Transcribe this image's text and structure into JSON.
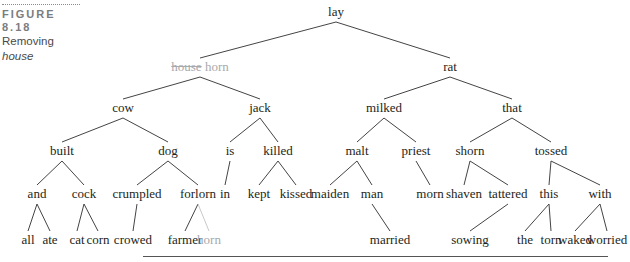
{
  "caption": {
    "label": "FIGURE 8.18",
    "title_prefix": "Removing ",
    "title_italic": "house"
  },
  "colors": {
    "text": "#231f20",
    "removed": "#a7a9ac",
    "line": "#444444",
    "removed_line": "#c8c9cb"
  },
  "tree": {
    "nodes": [
      {
        "id": "lay",
        "label": "lay",
        "x": 336,
        "y": 5
      },
      {
        "id": "househorn",
        "label": "house",
        "label2": "horn",
        "x": 200,
        "y": 60,
        "removed": true
      },
      {
        "id": "rat",
        "label": "rat",
        "x": 450,
        "y": 60
      },
      {
        "id": "cow",
        "label": "cow",
        "x": 123,
        "y": 101
      },
      {
        "id": "jack",
        "label": "jack",
        "x": 260,
        "y": 101
      },
      {
        "id": "milked",
        "label": "milked",
        "x": 384,
        "y": 101
      },
      {
        "id": "that",
        "label": "that",
        "x": 512,
        "y": 101
      },
      {
        "id": "built",
        "label": "built",
        "x": 62,
        "y": 144
      },
      {
        "id": "dog",
        "label": "dog",
        "x": 168,
        "y": 144
      },
      {
        "id": "is",
        "label": "is",
        "x": 230,
        "y": 144
      },
      {
        "id": "killed",
        "label": "killed",
        "x": 278,
        "y": 144
      },
      {
        "id": "malt",
        "label": "malt",
        "x": 357,
        "y": 144
      },
      {
        "id": "priest",
        "label": "priest",
        "x": 416,
        "y": 144
      },
      {
        "id": "shorn",
        "label": "shorn",
        "x": 470,
        "y": 144
      },
      {
        "id": "tossed",
        "label": "tossed",
        "x": 551,
        "y": 144
      },
      {
        "id": "and",
        "label": "and",
        "x": 37,
        "y": 187
      },
      {
        "id": "cock",
        "label": "cock",
        "x": 84,
        "y": 187
      },
      {
        "id": "crumpled",
        "label": "crumpled",
        "x": 137,
        "y": 187
      },
      {
        "id": "forlorn",
        "label": "forlorn",
        "x": 198,
        "y": 187
      },
      {
        "id": "in",
        "label": "in",
        "x": 225,
        "y": 187
      },
      {
        "id": "kept",
        "label": "kept",
        "x": 259,
        "y": 187
      },
      {
        "id": "kissed",
        "label": "kissed",
        "x": 296,
        "y": 187
      },
      {
        "id": "maiden",
        "label": "maiden",
        "x": 330,
        "y": 187
      },
      {
        "id": "man",
        "label": "man",
        "x": 372,
        "y": 187
      },
      {
        "id": "morn",
        "label": "morn",
        "x": 430,
        "y": 187
      },
      {
        "id": "shaven",
        "label": "shaven",
        "x": 464,
        "y": 187
      },
      {
        "id": "tattered",
        "label": "tattered",
        "x": 508,
        "y": 187
      },
      {
        "id": "this",
        "label": "this",
        "x": 549,
        "y": 187
      },
      {
        "id": "with",
        "label": "with",
        "x": 600,
        "y": 187
      },
      {
        "id": "all",
        "label": "all",
        "x": 28,
        "y": 233
      },
      {
        "id": "ate",
        "label": "ate",
        "x": 50,
        "y": 233
      },
      {
        "id": "cat",
        "label": "cat",
        "x": 77,
        "y": 233
      },
      {
        "id": "corn",
        "label": "corn",
        "x": 98,
        "y": 233
      },
      {
        "id": "crowed",
        "label": "crowed",
        "x": 133,
        "y": 233
      },
      {
        "id": "farmer",
        "label": "farmer",
        "x": 185,
        "y": 233
      },
      {
        "id": "horn",
        "label": "horn",
        "x": 209,
        "y": 233,
        "removed": true
      },
      {
        "id": "married",
        "label": "married",
        "x": 390,
        "y": 233
      },
      {
        "id": "sowing",
        "label": "sowing",
        "x": 470,
        "y": 233
      },
      {
        "id": "the",
        "label": "the",
        "x": 525,
        "y": 233
      },
      {
        "id": "torn",
        "label": "torn",
        "x": 551,
        "y": 233
      },
      {
        "id": "waked",
        "label": "waked",
        "x": 575,
        "y": 233
      },
      {
        "id": "worried",
        "label": "worried",
        "x": 607,
        "y": 233
      }
    ],
    "edges": [
      [
        "lay",
        "househorn"
      ],
      [
        "lay",
        "rat"
      ],
      [
        "househorn",
        "cow"
      ],
      [
        "househorn",
        "jack"
      ],
      [
        "rat",
        "milked"
      ],
      [
        "rat",
        "that"
      ],
      [
        "cow",
        "built"
      ],
      [
        "cow",
        "dog"
      ],
      [
        "jack",
        "is"
      ],
      [
        "jack",
        "killed"
      ],
      [
        "milked",
        "malt"
      ],
      [
        "milked",
        "priest"
      ],
      [
        "that",
        "shorn"
      ],
      [
        "that",
        "tossed"
      ],
      [
        "built",
        "and"
      ],
      [
        "built",
        "cock"
      ],
      [
        "dog",
        "crumpled"
      ],
      [
        "dog",
        "forlorn"
      ],
      [
        "is",
        "in"
      ],
      [
        "killed",
        "kept"
      ],
      [
        "killed",
        "kissed"
      ],
      [
        "malt",
        "maiden"
      ],
      [
        "malt",
        "man"
      ],
      [
        "priest",
        "morn"
      ],
      [
        "shorn",
        "shaven"
      ],
      [
        "shorn",
        "tattered"
      ],
      [
        "tossed",
        "this"
      ],
      [
        "tossed",
        "with"
      ],
      [
        "and",
        "all"
      ],
      [
        "and",
        "ate"
      ],
      [
        "cock",
        "cat"
      ],
      [
        "cock",
        "corn"
      ],
      [
        "crumpled",
        "crowed"
      ],
      [
        "forlorn",
        "farmer"
      ],
      [
        "forlorn",
        "horn"
      ],
      [
        "man",
        "married"
      ],
      [
        "tattered",
        "sowing"
      ],
      [
        "this",
        "the"
      ],
      [
        "this",
        "torn"
      ],
      [
        "with",
        "waked"
      ],
      [
        "with",
        "worried"
      ]
    ]
  }
}
